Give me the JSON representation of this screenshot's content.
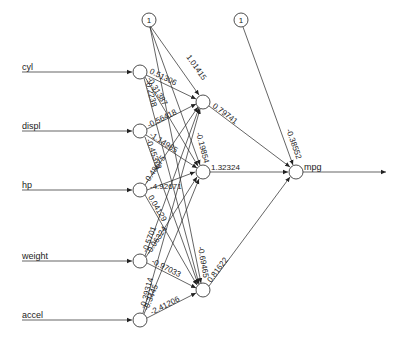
{
  "diagram": {
    "type": "neural-network",
    "inputs": [
      {
        "id": "cyl",
        "label": "cyl",
        "x": 140,
        "y": 72
      },
      {
        "id": "displ",
        "label": "displ",
        "x": 140,
        "y": 131
      },
      {
        "id": "hp",
        "label": "hp",
        "x": 140,
        "y": 190
      },
      {
        "id": "weight",
        "label": "weight",
        "x": 140,
        "y": 261
      },
      {
        "id": "accel",
        "label": "accel",
        "x": 140,
        "y": 320
      }
    ],
    "bias_nodes": [
      {
        "id": "b1",
        "label": "1",
        "x": 149,
        "y": 20
      },
      {
        "id": "b2",
        "label": "1",
        "x": 241,
        "y": 20
      }
    ],
    "hidden": [
      {
        "id": "h1",
        "x": 203,
        "y": 102
      },
      {
        "id": "h2",
        "x": 203,
        "y": 172
      },
      {
        "id": "h3",
        "x": 203,
        "y": 290
      }
    ],
    "output": {
      "id": "mpg",
      "label": "mpg",
      "x": 296,
      "y": 172
    },
    "weights": {
      "cyl_h1": "0.51306",
      "cyl_h2": "-0.31387",
      "cyl_h3": "-0.2238",
      "displ_h1": "-0.56418",
      "displ_h2": "-1.14985",
      "displ_h3": "-0.45373",
      "hp_h1": "-0.48675",
      "hp_h2": "-4.92671",
      "hp_h3": "0.04129",
      "weight_h1": "-0.5701",
      "weight_h2": "-0.06324",
      "weight_h3": "-0.97033",
      "accel_h1": "-0.39314",
      "accel_h2": "-0.3445",
      "accel_h3": "-2.41206",
      "b1_h1": "1.01415",
      "b1_h2": "-0.19854",
      "b1_h3": "-0.69465",
      "h1_out": "0.79741",
      "h2_out": "1.32324",
      "h3_out": "0.81622",
      "b2_out": "-0.38552"
    }
  }
}
